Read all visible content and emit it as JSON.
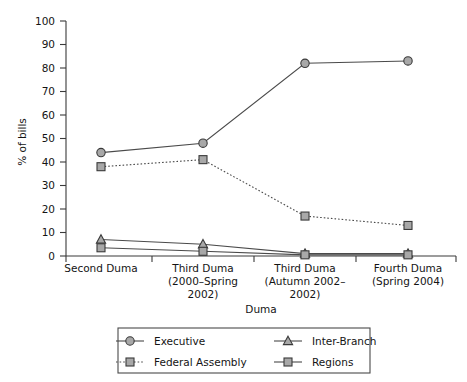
{
  "chart_data": {
    "type": "line",
    "title": "",
    "xlabel": "Duma",
    "ylabel": "% of bills",
    "ylim": [
      0,
      100
    ],
    "ytick_step": 10,
    "grid": false,
    "legend_position": "bottom",
    "categories": [
      "Second Duma",
      "Third Duma (2000–Spring 2002)",
      "Third Duma (Autumn 2002–2002)",
      "Fourth Duma (Spring 2004)"
    ],
    "category_lines": [
      [
        "Second Duma"
      ],
      [
        "Third Duma",
        "(2000–Spring",
        "2002)"
      ],
      [
        "Third Duma",
        "(Autumn 2002–",
        "2002)"
      ],
      [
        "Fourth Duma",
        "(Spring 2004)"
      ]
    ],
    "ytick_labels": [
      "0",
      "10",
      "20",
      "30",
      "40",
      "50",
      "60",
      "70",
      "80",
      "90",
      "100"
    ],
    "series": [
      {
        "name": "Executive",
        "marker": "circle",
        "style": "solid",
        "color": "#a8a8a8",
        "values": [
          44,
          48,
          82,
          83
        ]
      },
      {
        "name": "Federal Assembly",
        "marker": "square",
        "style": "dotted",
        "color": "#a8a8a8",
        "values": [
          38,
          41,
          17,
          13
        ]
      },
      {
        "name": "Inter-Branch",
        "marker": "triangle",
        "style": "solid",
        "color": "#a8a8a8",
        "values": [
          7,
          5,
          1,
          1
        ]
      },
      {
        "name": "Regions",
        "marker": "square",
        "style": "solid",
        "color": "#a8a8a8",
        "values": [
          3.5,
          2,
          0.5,
          0.5
        ]
      }
    ],
    "legend_entries": [
      {
        "label": "Executive",
        "marker": "circle",
        "style": "solid"
      },
      {
        "label": "Inter-Branch",
        "marker": "triangle",
        "style": "solid"
      },
      {
        "label": "Federal Assembly",
        "marker": "square",
        "style": "dotted"
      },
      {
        "label": "Regions",
        "marker": "square",
        "style": "solid"
      }
    ]
  }
}
